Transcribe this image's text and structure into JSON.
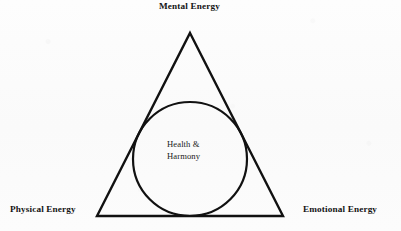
{
  "figure": {
    "title_label": "Mental Energy",
    "background_color": "#fbfbfb",
    "stroke_color": "#111111",
    "text_color": "#141414",
    "labels": {
      "top": "Mental Energy",
      "bottom_left": "Physical Energy",
      "bottom_right": "Emotional Energy"
    },
    "center": {
      "line1": "Health &",
      "line2": "Harmony"
    },
    "shapes": {
      "triangle": {
        "name": "energy-triangle",
        "apex": {
          "x": 190,
          "y": 33
        },
        "bottom_left": {
          "x": 97,
          "y": 216
        },
        "bottom_right": {
          "x": 283,
          "y": 216
        },
        "stroke_width": 2.4,
        "fill": "none"
      },
      "circle": {
        "name": "health-harmony-incircle",
        "center": {
          "x": 190,
          "y": 159
        },
        "radius": 57,
        "stroke_width": 2.2,
        "fill": "none"
      }
    }
  },
  "icons": {
    "triangle": "triangle-outline-icon",
    "circle": "circle-outline-icon"
  }
}
